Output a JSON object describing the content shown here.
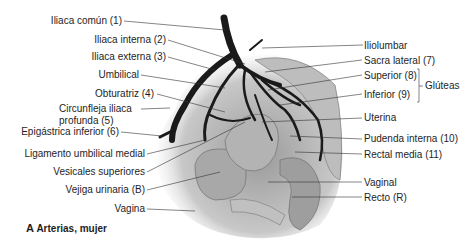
{
  "figure": {
    "caption_letter": "A",
    "caption_text": "Arterias, mujer",
    "left_labels": [
      {
        "id": "iliaca-comun",
        "text": "Iliaca común (1)"
      },
      {
        "id": "iliaca-interna",
        "text": "Iliaca interna (2)"
      },
      {
        "id": "iliaca-externa",
        "text": "Iliaca externa (3)"
      },
      {
        "id": "umbilical",
        "text": "Umbilical"
      },
      {
        "id": "obturatriz",
        "text": "Obturatriz (4)"
      },
      {
        "id": "circunfleja-1",
        "text": "Circunfleja iliaca"
      },
      {
        "id": "circunfleja-2",
        "text": "profunda (5)"
      },
      {
        "id": "epigastrica",
        "text": "Epigástrica inferior (6)"
      },
      {
        "id": "ligamento",
        "text": "Ligamento umbilical medial"
      },
      {
        "id": "vesicales",
        "text": "Vesicales superiores"
      },
      {
        "id": "vejiga",
        "text": "Vejiga urinaria (B)"
      },
      {
        "id": "vagina",
        "text": "Vagina"
      }
    ],
    "right_labels": [
      {
        "id": "iliolumbar",
        "text": "Iliolumbar"
      },
      {
        "id": "sacra-lateral",
        "text": "Sacra lateral (7)"
      },
      {
        "id": "superior",
        "text": "Superior (8)"
      },
      {
        "id": "inferior",
        "text": "Inferior (9)"
      },
      {
        "id": "uterina",
        "text": "Uterina"
      },
      {
        "id": "pudenda",
        "text": "Pudenda interna (10)"
      },
      {
        "id": "rectal-media",
        "text": "Rectal media (11)"
      },
      {
        "id": "vaginal",
        "text": "Vaginal"
      },
      {
        "id": "recto",
        "text": "Recto (R)"
      }
    ],
    "group_label": "Glúteas"
  }
}
